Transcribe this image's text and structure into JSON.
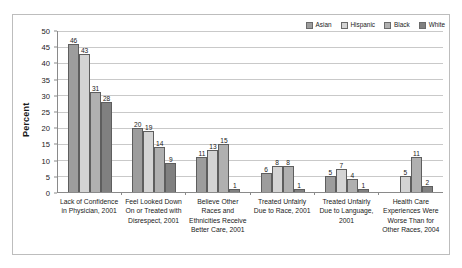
{
  "chart_data": {
    "type": "bar",
    "title": "",
    "xlabel": "",
    "ylabel": "Percent",
    "ylim": [
      0,
      50
    ],
    "yticks": [
      0,
      5,
      10,
      15,
      20,
      25,
      30,
      35,
      40,
      45,
      50
    ],
    "grid": true,
    "legend_position": "top-right",
    "categories": [
      "Lack of Confidence in Physician, 2001",
      "Feel Looked Down On or Treated with Disrespect, 2001",
      "Believe Other Races and Ethnicities Receive Better Care, 2001",
      "Treated Unfairly Due to Race, 2001",
      "Treated Unfairly Due to Language, 2001",
      "Health Care Experiences Were Worse Than for Other Races, 2004"
    ],
    "series": [
      {
        "name": "Asian",
        "color": "#9d9d9d",
        "values": [
          46,
          20,
          11,
          6,
          5,
          null
        ]
      },
      {
        "name": "Hispanic",
        "color": "#d4d4d4",
        "values": [
          43,
          19,
          13,
          8,
          7,
          5
        ]
      },
      {
        "name": "Black",
        "color": "#b0b0b0",
        "values": [
          31,
          14,
          15,
          8,
          4,
          11
        ]
      },
      {
        "name": "White",
        "color": "#808080",
        "values": [
          28,
          9,
          1,
          1,
          1,
          2
        ]
      }
    ]
  },
  "legend": {
    "items": [
      {
        "label": "Asian"
      },
      {
        "label": "Hispanic"
      },
      {
        "label": "Black"
      },
      {
        "label": "White"
      }
    ]
  },
  "axis": {
    "y_title": "Percent"
  }
}
